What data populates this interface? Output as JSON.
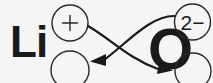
{
  "diagram": {
    "type": "criss-cross-ionic-formula",
    "background_color": "#f5f5f5",
    "ink_color": "#1a1a1a",
    "cation": {
      "symbol": "Li",
      "charge_text": "+",
      "charge_circled": true
    },
    "anion": {
      "symbol": "O",
      "charge_text": "2−",
      "charge_circled": true
    },
    "target_slots": [
      {
        "name": "lithium-subscript-slot",
        "value": ""
      },
      {
        "name": "oxygen-subscript-slot",
        "value": ""
      }
    ],
    "arrows": [
      {
        "name": "cation-charge-to-anion-subscript",
        "from": "lithium-charge",
        "to": "oxygen-subscript-slot",
        "direction": "right-down"
      },
      {
        "name": "anion-charge-to-cation-subscript",
        "from": "oxygen-charge",
        "to": "lithium-subscript-slot",
        "direction": "left-down"
      }
    ]
  }
}
